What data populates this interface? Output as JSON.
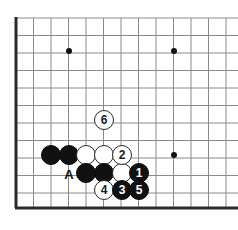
{
  "figure": {
    "kind": "go-board-diagram",
    "title": "",
    "background_color": "#ffffff"
  },
  "board": {
    "line_color": "#8a8a8a",
    "edge_color": "#2b2b2b",
    "origin_x": 16,
    "origin_y": 18,
    "spacing": 17.5,
    "cols": 13,
    "rows": 11,
    "edges": {
      "left_x": 16,
      "bottom_y": 208,
      "thickness": 3
    },
    "star_points": [
      {
        "name": "star-point-upper-left",
        "x": 69,
        "y": 51
      },
      {
        "name": "star-point-upper-right",
        "x": 174,
        "y": 51
      },
      {
        "name": "star-point-lower-right",
        "x": 174,
        "y": 155
      }
    ],
    "star_radius": 3
  },
  "stones": [
    {
      "id": "white-6",
      "color": "white",
      "label": "6",
      "x": 104,
      "y": 120,
      "r": 10
    },
    {
      "id": "black-plain-a",
      "color": "black",
      "label": "",
      "x": 51,
      "y": 155,
      "r": 10
    },
    {
      "id": "black-plain-b",
      "color": "black",
      "label": "",
      "x": 69,
      "y": 155,
      "r": 10
    },
    {
      "id": "white-plain-a",
      "color": "white",
      "label": "",
      "x": 86,
      "y": 155,
      "r": 10
    },
    {
      "id": "white-plain-b",
      "color": "white",
      "label": "",
      "x": 104,
      "y": 155,
      "r": 10
    },
    {
      "id": "white-2",
      "color": "white",
      "label": "2",
      "x": 122,
      "y": 155,
      "r": 10
    },
    {
      "id": "black-plain-c",
      "color": "black",
      "label": "",
      "x": 86,
      "y": 173,
      "r": 10
    },
    {
      "id": "black-plain-d",
      "color": "black",
      "label": "",
      "x": 104,
      "y": 173,
      "r": 10
    },
    {
      "id": "white-plain-c",
      "color": "white",
      "label": "",
      "x": 122,
      "y": 173,
      "r": 10
    },
    {
      "id": "black-1",
      "color": "black",
      "label": "1",
      "x": 139,
      "y": 173,
      "r": 10
    },
    {
      "id": "white-4",
      "color": "white",
      "label": "4",
      "x": 104,
      "y": 190,
      "r": 10
    },
    {
      "id": "black-3",
      "color": "black",
      "label": "3",
      "x": 122,
      "y": 190,
      "r": 10
    },
    {
      "id": "black-5",
      "color": "black",
      "label": "5",
      "x": 139,
      "y": 190,
      "r": 10
    }
  ],
  "markers": [
    {
      "id": "point-a",
      "label": "A",
      "x": 69,
      "y": 174
    }
  ]
}
